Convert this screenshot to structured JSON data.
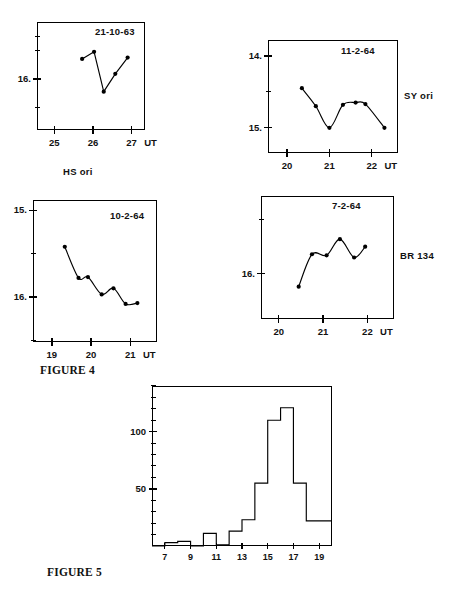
{
  "figures": [
    {
      "caption": "FIGURE 4",
      "panels": [
        {
          "id": "hs-ori",
          "date": "21-10-63",
          "star": "HS ori",
          "star_position": "below",
          "xlabel": "UT",
          "xticks": [
            "25",
            "26",
            "27"
          ],
          "xtick_values": [
            25,
            26,
            27
          ],
          "yticks": [
            "16."
          ],
          "ytick_values": [
            16.0
          ],
          "xlim": [
            24.55,
            27.35
          ],
          "ylim_mag": [
            15.2,
            16.72
          ],
          "minor_yticks": [
            15.4,
            15.6,
            16.0,
            16.4
          ],
          "points": [
            {
              "x": 25.72,
              "y": 15.72
            },
            {
              "x": 26.03,
              "y": 15.62
            },
            {
              "x": 26.28,
              "y": 16.18
            },
            {
              "x": 26.58,
              "y": 15.93
            },
            {
              "x": 26.9,
              "y": 15.7
            }
          ],
          "curve": "polyline"
        },
        {
          "id": "sy-ori",
          "date": "11-2-64",
          "star": "SY ori",
          "star_position": "right",
          "xlabel": "UT",
          "xticks": [
            "20",
            "21",
            "22"
          ],
          "xtick_values": [
            20,
            21,
            22
          ],
          "yticks": [
            "14.",
            "15."
          ],
          "ytick_values": [
            14.0,
            15.0
          ],
          "xlim": [
            19.55,
            22.62
          ],
          "ylim_mag": [
            13.78,
            15.35
          ],
          "minor_yticks": [
            14.5
          ],
          "points": [
            {
              "x": 20.35,
              "y": 14.45
            },
            {
              "x": 20.68,
              "y": 14.7
            },
            {
              "x": 21.0,
              "y": 15.0
            },
            {
              "x": 21.32,
              "y": 14.68
            },
            {
              "x": 21.62,
              "y": 14.65
            },
            {
              "x": 21.85,
              "y": 14.67
            },
            {
              "x": 22.3,
              "y": 15.0
            }
          ],
          "curve": "smooth"
        },
        {
          "id": "br-134-a",
          "date": "10-2-64",
          "star": "",
          "star_position": "none",
          "xlabel": "UT",
          "xticks": [
            "19",
            "20",
            "21"
          ],
          "xtick_values": [
            19,
            20,
            21
          ],
          "yticks": [
            "15.",
            "16."
          ],
          "ytick_values": [
            15.0,
            16.0
          ],
          "xlim": [
            18.52,
            21.68
          ],
          "ylim_mag": [
            14.88,
            16.52
          ],
          "minor_yticks": [
            15.5,
            16.5
          ],
          "points": [
            {
              "x": 19.33,
              "y": 15.42
            },
            {
              "x": 19.68,
              "y": 15.78
            },
            {
              "x": 19.92,
              "y": 15.77
            },
            {
              "x": 20.27,
              "y": 15.97
            },
            {
              "x": 20.57,
              "y": 15.9
            },
            {
              "x": 20.88,
              "y": 16.08
            },
            {
              "x": 21.18,
              "y": 16.07
            }
          ],
          "curve": "smooth"
        },
        {
          "id": "br-134-b",
          "date": "7-2-64",
          "star": "BR 134",
          "star_position": "right",
          "xlabel": "UT",
          "xticks": [
            "20",
            "21",
            "22"
          ],
          "xtick_values": [
            20,
            21,
            22
          ],
          "yticks": [
            "16."
          ],
          "ytick_values": [
            16.0
          ],
          "xlim": [
            19.6,
            22.6
          ],
          "ylim_mag": [
            15.28,
            16.42
          ],
          "minor_yticks": [
            15.5
          ],
          "points": [
            {
              "x": 20.45,
              "y": 16.12
            },
            {
              "x": 20.75,
              "y": 15.82
            },
            {
              "x": 21.08,
              "y": 15.83
            },
            {
              "x": 21.38,
              "y": 15.68
            },
            {
              "x": 21.7,
              "y": 15.85
            },
            {
              "x": 21.95,
              "y": 15.75
            }
          ],
          "curve": "smooth"
        }
      ]
    }
  ],
  "histogram_caption": "FIGURE 5",
  "chart_data": [
    {
      "type": "line",
      "id": "hs-ori",
      "title": "21-10-63",
      "subtitle": "HS ori",
      "xlabel": "UT",
      "ylabel": "",
      "x": [
        25.72,
        26.03,
        26.28,
        26.58,
        26.9
      ],
      "values": [
        15.72,
        15.62,
        16.18,
        15.93,
        15.7
      ],
      "xlim": [
        24.55,
        27.35
      ],
      "ylim": [
        16.72,
        15.2
      ],
      "xticks": [
        25,
        26,
        27
      ],
      "yticks": [
        16.0
      ],
      "grid": false,
      "legend": "none",
      "note": "magnitude axis inverted (brighter upward)"
    },
    {
      "type": "line",
      "id": "sy-ori",
      "title": "11-2-64",
      "subtitle": "SY ori",
      "xlabel": "UT",
      "ylabel": "",
      "x": [
        20.35,
        20.68,
        21.0,
        21.32,
        21.62,
        21.85,
        22.3
      ],
      "values": [
        14.45,
        14.7,
        15.0,
        14.68,
        14.65,
        14.67,
        15.0
      ],
      "xlim": [
        19.55,
        22.62
      ],
      "ylim": [
        15.35,
        13.78
      ],
      "xticks": [
        20,
        21,
        22
      ],
      "yticks": [
        14.0,
        15.0
      ],
      "grid": false,
      "legend": "none",
      "note": "magnitude axis inverted (brighter upward)"
    },
    {
      "type": "line",
      "id": "br-134-a",
      "title": "10-2-64",
      "subtitle": "",
      "xlabel": "UT",
      "ylabel": "",
      "x": [
        19.33,
        19.68,
        19.92,
        20.27,
        20.57,
        20.88,
        21.18
      ],
      "values": [
        15.42,
        15.78,
        15.77,
        15.97,
        15.9,
        16.08,
        16.07
      ],
      "xlim": [
        18.52,
        21.68
      ],
      "ylim": [
        16.52,
        14.88
      ],
      "xticks": [
        19,
        20,
        21
      ],
      "yticks": [
        15.0,
        16.0
      ],
      "grid": false,
      "legend": "none",
      "note": "magnitude axis inverted (brighter upward)"
    },
    {
      "type": "line",
      "id": "br-134-b",
      "title": "7-2-64",
      "subtitle": "BR 134",
      "xlabel": "UT",
      "ylabel": "",
      "x": [
        20.45,
        20.75,
        21.08,
        21.38,
        21.7,
        21.95
      ],
      "values": [
        16.12,
        15.82,
        15.83,
        15.68,
        15.85,
        15.75
      ],
      "xlim": [
        19.6,
        22.6
      ],
      "ylim": [
        16.42,
        15.28
      ],
      "xticks": [
        20,
        21,
        22
      ],
      "yticks": [
        16.0
      ],
      "grid": false,
      "legend": "none",
      "note": "magnitude axis inverted (brighter upward)"
    },
    {
      "type": "bar",
      "id": "figure-5-histogram",
      "title": "FIGURE 5",
      "xlabel": "",
      "ylabel": "",
      "categories": [
        "6-7",
        "7-8",
        "8-9",
        "9-10",
        "10-11",
        "11-12",
        "12-13",
        "13-14",
        "14-15",
        "15-16",
        "16-17",
        "17-18",
        "18-19",
        "19-20"
      ],
      "bin_edges": [
        6,
        7,
        8,
        9,
        10,
        11,
        12,
        13,
        14,
        15,
        16,
        17,
        18,
        19,
        20
      ],
      "values": [
        0,
        3,
        4,
        0,
        11,
        1,
        13,
        23,
        55,
        110,
        121,
        55,
        22,
        22
      ],
      "xlim": [
        6,
        20
      ],
      "ylim": [
        0,
        140
      ],
      "xticks": [
        7,
        9,
        11,
        13,
        15,
        17,
        19
      ],
      "yticks": [
        50,
        100
      ],
      "ytick_labels": [
        "50",
        "100"
      ],
      "minor_ytick_step": 10,
      "grid": false,
      "legend": "none",
      "style": "step-outline"
    }
  ]
}
